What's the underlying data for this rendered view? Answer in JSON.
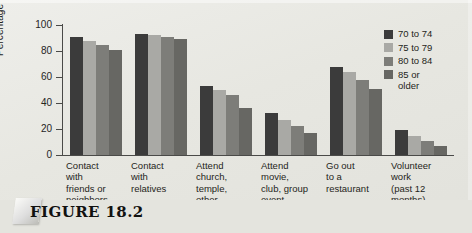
{
  "figure": {
    "caption": "FIGURE 18.2"
  },
  "chart_data": {
    "type": "bar",
    "title": "",
    "xlabel": "",
    "ylabel": "Percentage",
    "ylim": [
      0,
      100
    ],
    "yticks": [
      0,
      20,
      40,
      60,
      80,
      100
    ],
    "grid": false,
    "legend_position": "right",
    "categories": [
      "Contact\nwith\nfriends or\nneighbors",
      "Contact\nwith\nrelatives",
      "Attend\nchurch,\ntemple,\nother",
      "Attend\nmovie,\nclub, group\nevent",
      "Go out\nto a\nrestaurant",
      "Volunteer\nwork\n(past 12\nmonths)"
    ],
    "series": [
      {
        "name": "70 to 74",
        "color": "#3b3b3b",
        "values": [
          91,
          93,
          53,
          32,
          68,
          19
        ]
      },
      {
        "name": "75 to 79",
        "color": "#a9a9a5",
        "values": [
          88,
          92,
          50,
          27,
          64,
          15
        ]
      },
      {
        "name": "80 to 84",
        "color": "#7d7d79",
        "values": [
          85,
          91,
          46,
          22,
          58,
          11
        ]
      },
      {
        "name": "85 or\nolder",
        "color": "#676763",
        "values": [
          81,
          89,
          36,
          17,
          51,
          7
        ]
      }
    ]
  }
}
